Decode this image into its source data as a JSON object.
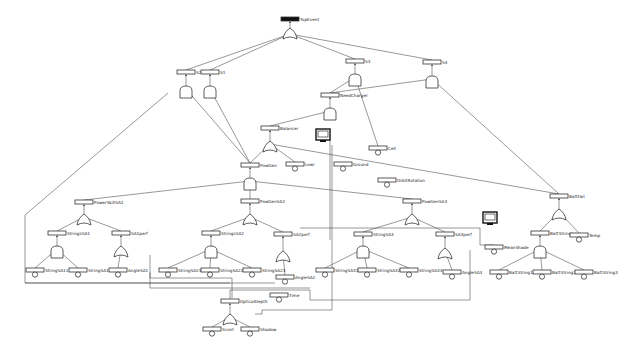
{
  "diagram": {
    "type": "fault-tree",
    "top_event": {
      "id": "TopEvent",
      "label": "TopEvent",
      "x": 290,
      "y": 17,
      "gate": "or",
      "gate_y": 30
    },
    "gates": [
      {
        "id": "S2",
        "label": "S2",
        "x": 186,
        "y": 70,
        "gate": "and",
        "gate_y": 88
      },
      {
        "id": "S1",
        "label": "S1",
        "x": 210,
        "y": 70,
        "gate": "and",
        "gate_y": 88
      },
      {
        "id": "S3",
        "label": "S3",
        "x": 355,
        "y": 59,
        "gate": "and",
        "gate_y": 76
      },
      {
        "id": "S4",
        "label": "S4",
        "x": 432,
        "y": 60,
        "gate": "and",
        "gate_y": 78
      },
      {
        "id": "NeedCharger",
        "label": "NeedCharger",
        "x": 330,
        "y": 93,
        "gate": "and",
        "gate_y": 110
      },
      {
        "id": "Balancer",
        "label": "Balancer",
        "x": 270,
        "y": 126,
        "gate": "or",
        "gate_y": 143
      },
      {
        "id": "PowGen",
        "label": "PowGen",
        "x": 250,
        "y": 163,
        "gate": "and",
        "gate_y": 180
      },
      {
        "id": "PowGenSA2",
        "label": "PowGenSA2",
        "x": 250,
        "y": 199,
        "gate": "or",
        "gate_y": 216
      },
      {
        "id": "PowGenSA3",
        "label": "PowGenSA3",
        "x": 412,
        "y": 199,
        "gate": "or",
        "gate_y": 216
      },
      {
        "id": "PowerSkillSA1",
        "label": "PowerSkillSA1",
        "x": 84,
        "y": 200,
        "gate": "or",
        "gate_y": 216
      },
      {
        "id": "StringsSA1",
        "label": "StringsSA1",
        "x": 57,
        "y": 231,
        "gate": "and",
        "gate_y": 248
      },
      {
        "id": "SA1perf",
        "label": "SA1perf",
        "x": 121,
        "y": 231,
        "gate": "or",
        "gate_y": 248
      },
      {
        "id": "StringsSA2",
        "label": "StringsSA2",
        "x": 211,
        "y": 231,
        "gate": "and",
        "gate_y": 248
      },
      {
        "id": "SA2perf",
        "label": "SA2perf",
        "x": 283,
        "y": 232,
        "gate": "or",
        "gate_y": 253
      },
      {
        "id": "StringSA3",
        "label": "StringSA3",
        "x": 363,
        "y": 232,
        "gate": "and",
        "gate_y": 248
      },
      {
        "id": "SA3perf",
        "label": "SA3perf",
        "x": 445,
        "y": 232,
        "gate": "or",
        "gate_y": 250
      },
      {
        "id": "BattFail",
        "label": "BattFail",
        "x": 559,
        "y": 194,
        "gate": "or",
        "gate_y": 211
      },
      {
        "id": "BattStrings",
        "label": "BattStrings",
        "x": 540,
        "y": 231,
        "gate": "and",
        "gate_y": 248
      },
      {
        "id": "OpticalDepth",
        "label": "OpticalDepth",
        "x": 230,
        "y": 299,
        "gate": "or",
        "gate_y": 316
      }
    ],
    "basic_events": [
      {
        "id": "Lowl",
        "label": "Lowl",
        "x": 295,
        "y": 162
      },
      {
        "id": "Ground",
        "label": "Ground",
        "x": 343,
        "y": 162
      },
      {
        "id": "Cell",
        "label": "Cell",
        "x": 378,
        "y": 146
      },
      {
        "id": "OrbitRotation",
        "label": "OrbitRotation",
        "x": 387,
        "y": 178
      },
      {
        "id": "StringSA11",
        "label": "StringSA11",
        "x": 35,
        "y": 268
      },
      {
        "id": "StringSA12",
        "label": "StringSA12",
        "x": 78,
        "y": 268
      },
      {
        "id": "AngleSA1",
        "label": "AngleSA1",
        "x": 118,
        "y": 268
      },
      {
        "id": "StringSA21",
        "label": "StringSA21",
        "x": 168,
        "y": 268
      },
      {
        "id": "StringSA22",
        "label": "StringSA22",
        "x": 210,
        "y": 268
      },
      {
        "id": "StringSA23",
        "label": "StringSA23",
        "x": 252,
        "y": 268
      },
      {
        "id": "AngleSA2",
        "label": "AngleSA2",
        "x": 285,
        "y": 275
      },
      {
        "id": "Time",
        "label": "Time",
        "x": 279,
        "y": 293
      },
      {
        "id": "StringSA31",
        "label": "StringSA31",
        "x": 325,
        "y": 268
      },
      {
        "id": "StringSA32",
        "label": "StringSA32",
        "x": 367,
        "y": 268
      },
      {
        "id": "StringSA33",
        "label": "StringSA33",
        "x": 409,
        "y": 268
      },
      {
        "id": "AngleSA3",
        "label": "AngleSA3",
        "x": 452,
        "y": 270
      },
      {
        "id": "MeanShade",
        "label": "MeanShade",
        "x": 494,
        "y": 245
      },
      {
        "id": "BattString1",
        "label": "BattString1",
        "x": 499,
        "y": 270
      },
      {
        "id": "BattString2",
        "label": "BattString2",
        "x": 542,
        "y": 270
      },
      {
        "id": "BattString3",
        "label": "BattString3",
        "x": 584,
        "y": 270
      },
      {
        "id": "Temp",
        "label": "Temp",
        "x": 579,
        "y": 233
      },
      {
        "id": "Scont",
        "label": "Scont",
        "x": 212,
        "y": 327
      },
      {
        "id": "Shadow",
        "label": "Shadow",
        "x": 250,
        "y": 327
      }
    ],
    "monitors": [
      {
        "id": "monitor-1",
        "x": 323,
        "y": 137
      },
      {
        "id": "monitor-2",
        "x": 490,
        "y": 220
      }
    ]
  }
}
